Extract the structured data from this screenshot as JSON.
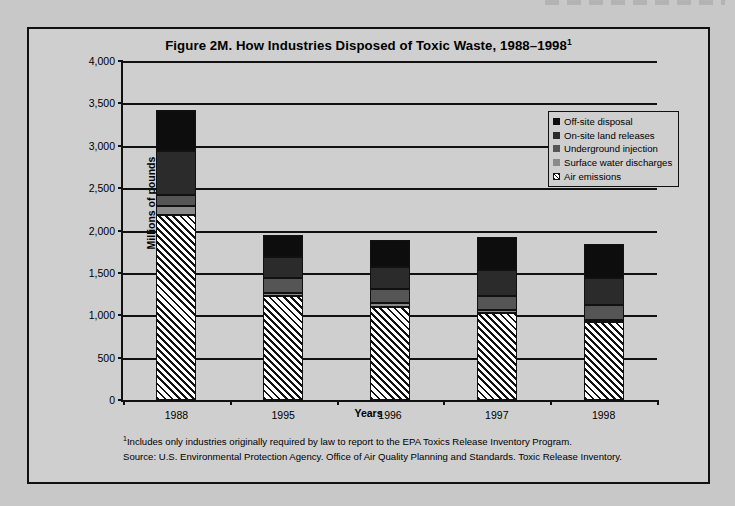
{
  "figure": {
    "title_main": "Figure 2M. How Industries Disposed of  Toxic Waste, 1988–1998",
    "title_superscript": "1"
  },
  "footnotes": {
    "marker": "1",
    "note": "Includes only industries originally required by law to report to the EPA Toxics Release Inventory Program.",
    "source": "Source: U.S. Environmental Protection Agency. Office of Air Quality Planning and Standards. Toxic Release Inventory."
  },
  "colors": {
    "page_background": "#c8c8c8",
    "panel_background": "#cfcfcf",
    "axis": "#111111",
    "off_site_disposal": "#0d0d0d",
    "on_site_land_releases": "#2b2b2b",
    "underground_injection": "#555555",
    "surface_water_discharges": "#8a8a8a",
    "air_emissions_hatch_dark": "#111111",
    "air_emissions_hatch_light": "#ffffff"
  },
  "chart_data": {
    "type": "bar",
    "subtype": "stacked-vertical",
    "title": "Figure 2M. How Industries Disposed of  Toxic Waste, 1988–1998",
    "xlabel": "Years",
    "ylabel": "Millions of pounds",
    "ylim": [
      0,
      4000
    ],
    "ytick_step": 500,
    "ytick_labels": [
      "0",
      "500",
      "1,000",
      "1,500",
      "2,000",
      "2,500",
      "3,000",
      "3,500",
      "4,000"
    ],
    "ytick_values": [
      0,
      500,
      1000,
      1500,
      2000,
      2500,
      3000,
      3500,
      4000
    ],
    "grid": "horizontal",
    "legend_position": "upper-right-inside",
    "categories": [
      "1988",
      "1995",
      "1996",
      "1997",
      "1998"
    ],
    "stack_order_bottom_to_top": [
      "Air emissions",
      "Surface water discharges",
      "Underground injection",
      "On-site land releases",
      "Off-site disposal"
    ],
    "series": [
      {
        "name": "Air emissions",
        "swatch": "hatch",
        "color": "#ffffff",
        "values": [
          2180,
          1230,
          1100,
          1030,
          920
        ]
      },
      {
        "name": "Surface water discharges",
        "swatch": "solid",
        "color": "#8a8a8a",
        "values": [
          110,
          35,
          40,
          30,
          30
        ]
      },
      {
        "name": "Underground injection",
        "swatch": "solid",
        "color": "#555555",
        "values": [
          130,
          170,
          170,
          170,
          170
        ]
      },
      {
        "name": "On-site land releases",
        "swatch": "solid",
        "color": "#2b2b2b",
        "values": [
          520,
          250,
          260,
          300,
          320
        ]
      },
      {
        "name": "Off-site disposal",
        "swatch": "solid",
        "color": "#0d0d0d",
        "values": [
          480,
          265,
          320,
          390,
          400
        ]
      }
    ],
    "totals": [
      3420,
      1950,
      1890,
      1920,
      1840
    ]
  }
}
